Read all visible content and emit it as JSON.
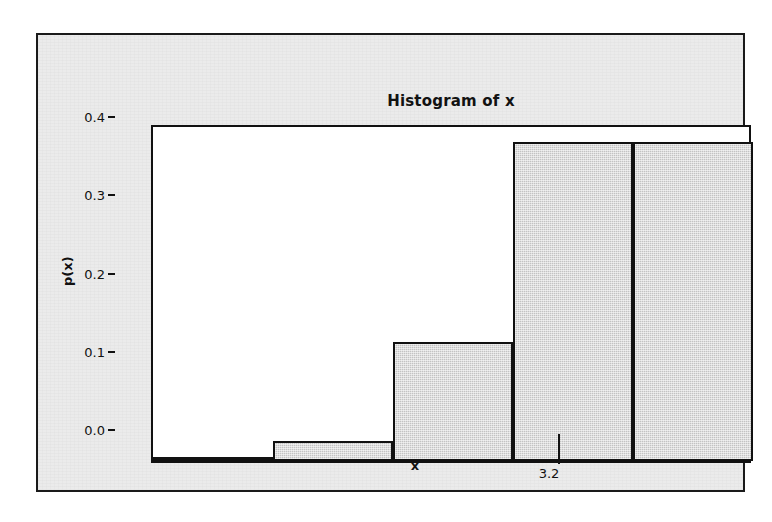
{
  "figure": {
    "background_color": "#ebebeb",
    "border_color": "#1a1a1a",
    "plot_background_color": "#ffffff"
  },
  "chart_data": {
    "type": "bar",
    "title": "Histogram of x",
    "xlabel": "x",
    "ylabel": "p(x)",
    "categories": [
      "0",
      "1",
      "2",
      "3",
      "4"
    ],
    "values": [
      0.003,
      0.025,
      0.152,
      0.408,
      0.408
    ],
    "bar_fill_color": "#c3c3c3",
    "bar_edge_color": "#111111",
    "bin_width": 1,
    "xlim": [
      -0.5,
      4.5
    ],
    "ylim": [
      0.0,
      0.432
    ],
    "grid": false,
    "legend": null,
    "x_ticks": [
      {
        "value": 0,
        "label": "0"
      },
      {
        "value": 1,
        "label": "1"
      },
      {
        "value": 2,
        "label": "2"
      },
      {
        "value": 3,
        "label": "3"
      },
      {
        "value": 4,
        "label": "4"
      }
    ],
    "y_ticks": [
      {
        "value": 0.0,
        "label": "0.0"
      },
      {
        "value": 0.1,
        "label": "0.1"
      },
      {
        "value": 0.2,
        "label": "0.2"
      },
      {
        "value": 0.3,
        "label": "0.3"
      },
      {
        "value": 0.4,
        "label": "0.4"
      }
    ],
    "annotations": [
      {
        "name": "mean-marker",
        "label": "3.2",
        "x_value": 3.2
      }
    ]
  }
}
